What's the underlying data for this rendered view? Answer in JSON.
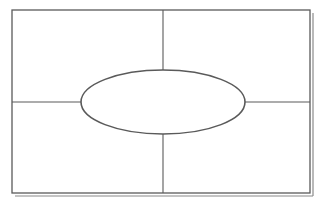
{
  "diagram": {
    "type": "four-square graphic organizer with central oval",
    "canvas": {
      "width": 324,
      "height": 205
    },
    "colors": {
      "background": "#ffffff",
      "line": "#5a5a5a",
      "frame_shadow": "#8a8a8a"
    },
    "frame": {
      "x": 12,
      "y": 10,
      "width": 298,
      "height": 183,
      "stroke_width": 1.3
    },
    "frame_shadow": {
      "offset": 3
    },
    "dividers": {
      "vertical": {
        "x": 163,
        "y1": 10,
        "y2": 193
      },
      "horizontal": {
        "y": 102,
        "x1": 12,
        "x2": 310
      }
    },
    "center_oval": {
      "cx": 163,
      "cy": 102,
      "rx": 82,
      "ry": 32,
      "stroke_width": 1.6,
      "label": ""
    },
    "quadrants": [
      {
        "name": "top-left",
        "label": ""
      },
      {
        "name": "top-right",
        "label": ""
      },
      {
        "name": "bottom-left",
        "label": ""
      },
      {
        "name": "bottom-right",
        "label": ""
      }
    ]
  }
}
